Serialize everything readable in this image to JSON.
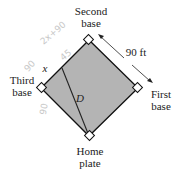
{
  "diagram": {
    "labels": {
      "second_base": [
        "Second",
        "base"
      ],
      "third_base": [
        "Third",
        "base"
      ],
      "first_base": [
        "First",
        "base"
      ],
      "home_plate": [
        "Home",
        "plate"
      ],
      "side_length": "90 ft",
      "segment_x": "x",
      "diagonal_d": "D"
    },
    "handwritten": {
      "top_left": "2x+90",
      "near_x": "45",
      "left_side": "90",
      "bottom_left": "90"
    },
    "colors": {
      "field": "#b4b4b4",
      "outline": "#111111"
    }
  }
}
